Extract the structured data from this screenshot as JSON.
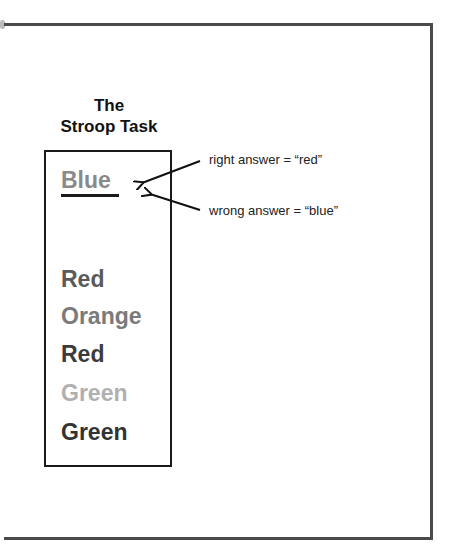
{
  "title": {
    "line1": "The",
    "line2": "Stroop Task"
  },
  "example_word": {
    "text": "Blue",
    "color": "#8a8a8a"
  },
  "annotations": {
    "right": "right answer = “red”",
    "wrong": "wrong answer = “blue”"
  },
  "words": [
    {
      "text": "Red",
      "color": "#5a5a5a"
    },
    {
      "text": "Orange",
      "color": "#7a7a7a"
    },
    {
      "text": "Red",
      "color": "#3c3c3c"
    },
    {
      "text": "Green",
      "color": "#b0b0b0"
    },
    {
      "text": "Green",
      "color": "#333333"
    }
  ]
}
